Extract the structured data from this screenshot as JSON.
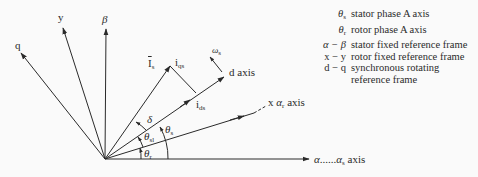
{
  "diagram": {
    "title": "",
    "origin": [
      105,
      159
    ],
    "axes": [
      {
        "id": "alpha",
        "label_main": "α",
        "label_dots": "......",
        "label_sym": "α",
        "label_sub": "s",
        "label_suffix": " axis",
        "tip": [
          309,
          159
        ]
      },
      {
        "id": "beta",
        "label": "β",
        "tip": [
          106,
          28
        ]
      },
      {
        "id": "y",
        "label": "y",
        "tip": [
          63,
          27
        ]
      },
      {
        "id": "q",
        "label": "q",
        "tip": [
          21,
          53
        ]
      },
      {
        "id": "x",
        "label_prefix": "x ",
        "label_sym": "α",
        "label_sub": "r",
        "label_suffix": " axis",
        "tip": [
          250,
          114
        ],
        "dashed_to": [
          264,
          106
        ]
      },
      {
        "id": "d",
        "label": "d axis",
        "tip": [
          224,
          77
        ]
      }
    ],
    "vectors": [
      {
        "id": "Is",
        "label": "I",
        "label_sub": "s",
        "overbar": true,
        "tip": [
          170,
          66
        ]
      },
      {
        "id": "iqs",
        "label": "i",
        "label_sub": "qs"
      },
      {
        "id": "ids",
        "label": "i",
        "label_sub": "ds",
        "point": [
          195,
          93
        ]
      },
      {
        "id": "omega_s",
        "label": "ω",
        "label_sub": "s"
      }
    ],
    "angles": [
      {
        "id": "delta",
        "label": "δ"
      },
      {
        "id": "theta_s",
        "label": "θ",
        "label_sub": "s"
      },
      {
        "id": "theta_sl",
        "label": "θ",
        "label_sub": "sl"
      },
      {
        "id": "theta_r",
        "label": "θ",
        "label_sub": "r"
      }
    ]
  },
  "legend": [
    {
      "symbol": "θ",
      "symbol_sub": "s",
      "desc": "stator phase A axis"
    },
    {
      "symbol": "θ",
      "symbol_sub": "r",
      "desc": "rotor phase A axis"
    },
    {
      "symbol": "α − β",
      "symbol_sub": "",
      "desc": "stator fixed reference frame"
    },
    {
      "symbol": "x − y",
      "symbol_sub": "",
      "desc": "rotor fixed reference frame"
    },
    {
      "symbol": "d − q",
      "symbol_sub": "",
      "desc": "synchronous rotating"
    },
    {
      "symbol": "",
      "symbol_sub": "",
      "desc": "reference frame"
    }
  ],
  "colors": {
    "line": "#2a2a2a",
    "background": "#fafafa"
  }
}
